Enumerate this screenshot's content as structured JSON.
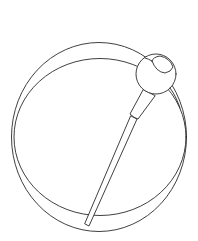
{
  "illustration": {
    "subject": "Penannular brooch line drawing",
    "style": "black line art on white",
    "colors": {
      "background": "#ffffff",
      "line": "#2a2a2a"
    },
    "parts": [
      {
        "id": "outer-ring",
        "label": "Outer edge of ring"
      },
      {
        "id": "inner-ring",
        "label": "Inner edge of ring"
      },
      {
        "id": "pin-head",
        "label": "Spherical pin head"
      },
      {
        "id": "pin-collar",
        "label": "Pin collar"
      },
      {
        "id": "pin-shaft",
        "label": "Pin shaft"
      }
    ]
  }
}
